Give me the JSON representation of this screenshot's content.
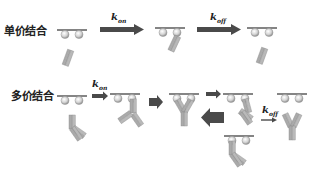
{
  "diagram": {
    "rows": [
      {
        "id": "monovalent",
        "label": "单价结合",
        "steps": [
          {
            "state": "unbound",
            "description": "Surface with two antigens, free monovalent fragment"
          },
          {
            "arrow": "k_on",
            "rate_symbol": "k",
            "rate_sub": "on"
          },
          {
            "state": "bound",
            "description": "Fragment bound to one antigen"
          },
          {
            "arrow": "k_off",
            "rate_symbol": "k",
            "rate_sub": "off"
          },
          {
            "state": "dissociated",
            "description": "Fragment released from surface"
          }
        ]
      },
      {
        "id": "multivalent",
        "label": "多价结合",
        "steps": [
          {
            "state": "unbound",
            "description": "Surface with two antigens, free bivalent antibody"
          },
          {
            "arrow": "k_on",
            "rate_symbol": "k",
            "rate_sub": "on"
          },
          {
            "state": "one-arm-bound",
            "description": "Antibody bound by one arm"
          },
          {
            "arrow": "rebind",
            "direction": "forward"
          },
          {
            "state": "two-arm-bound",
            "description": "Antibody bound by both arms"
          },
          {
            "arrow": "partial-release",
            "direction": "forward-small"
          },
          {
            "state": "one-arm-bound",
            "description": "One arm released"
          },
          {
            "arrow": "rebind",
            "direction": "backward-large"
          },
          {
            "state": "one-arm-bound-alt",
            "description": "Other arm bound"
          },
          {
            "arrow": "k_off",
            "rate_symbol": "k",
            "rate_sub": "off"
          },
          {
            "state": "dissociated",
            "description": "Antibody released from surface"
          }
        ]
      }
    ],
    "colors": {
      "antibody": "#a9a9a9",
      "antibody_stroke": "#8a8a8a",
      "arrow": "#4a4a4a",
      "surface": "#333333",
      "antigen": "#cfcfcf"
    }
  }
}
